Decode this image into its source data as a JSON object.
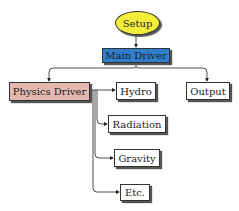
{
  "nodes": {
    "setup": {
      "label": "Setup",
      "color": "#f5ef3c"
    },
    "main_driver": {
      "label": "Main Driver",
      "color": "#2f7fce"
    },
    "physics_driver": {
      "label": "Physics Driver",
      "color": "#e4b7af"
    },
    "hydro": {
      "label": "Hydro"
    },
    "output": {
      "label": "Output"
    },
    "radiation": {
      "label": "Radiation"
    },
    "gravity": {
      "label": "Gravity"
    },
    "etc": {
      "label": "Etc."
    }
  },
  "edges": [
    {
      "from": "Setup",
      "to": "Main Driver"
    },
    {
      "from": "Main Driver",
      "to": "Physics Driver"
    },
    {
      "from": "Main Driver",
      "to": "Output"
    },
    {
      "from": "Physics Driver",
      "to": "Hydro"
    },
    {
      "from": "Physics Driver",
      "to": "Radiation"
    },
    {
      "from": "Physics Driver",
      "to": "Gravity"
    },
    {
      "from": "Physics Driver",
      "to": "Etc."
    }
  ]
}
